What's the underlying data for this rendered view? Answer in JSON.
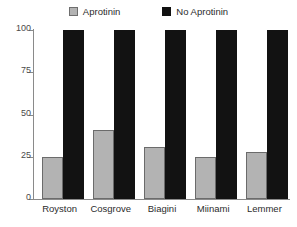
{
  "chart_data": {
    "type": "bar",
    "title": "",
    "subtitle": "",
    "xlabel": "",
    "ylabel": "",
    "categories": [
      "Royston",
      "Cosgrove",
      "Biagini",
      "Miinami",
      "Lemmer"
    ],
    "series": [
      {
        "name": "Aprotinin",
        "color": "#b3b3b3",
        "border_color": "#6b6b6b",
        "values": [
          25,
          41,
          31,
          25,
          28
        ]
      },
      {
        "name": "No Aprotinin",
        "color": "#121212",
        "border_color": "#121212",
        "values": [
          100,
          100,
          100,
          100,
          100
        ]
      }
    ],
    "ylim": [
      0,
      100
    ],
    "yticks": [
      0,
      25,
      50,
      75,
      100
    ],
    "ytick_labels": [
      "0",
      "25",
      "50",
      "75",
      "100"
    ],
    "grid": false,
    "legend_position": "top-center",
    "axis_color": "#8a8a8a",
    "text_color": "#2b2b2b",
    "background": "#ffffff"
  },
  "legend": {
    "entries": [
      {
        "label": "Aprotinin",
        "swatch": "gray-square-swatch"
      },
      {
        "label": "No Aprotinin",
        "swatch": "black-square-swatch"
      }
    ]
  }
}
